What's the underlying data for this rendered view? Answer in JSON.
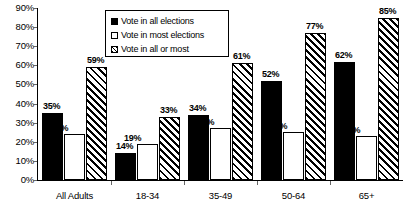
{
  "chart_data": {
    "type": "bar",
    "title": "",
    "xlabel": "",
    "ylabel": "",
    "ylim": [
      0,
      90
    ],
    "grid": false,
    "legend_position": "top-center",
    "categories": [
      "All Adults",
      "18-34",
      "35-49",
      "50-64",
      "65+"
    ],
    "y_ticks": [
      "0%",
      "10%",
      "20%",
      "30%",
      "40%",
      "50%",
      "60%",
      "70%",
      "80%",
      "90%"
    ],
    "series": [
      {
        "name": "Vote in all elections",
        "style": "solid-black",
        "values": [
          35,
          14,
          34,
          52,
          62
        ],
        "labels": [
          "35%",
          "14%",
          "34%",
          "52%",
          "62%"
        ]
      },
      {
        "name": "Vote in most elections",
        "style": "white-outline",
        "values": [
          24,
          19,
          27,
          25,
          23
        ],
        "labels": [
          "24%",
          "19%",
          "27%",
          "25%",
          "23%"
        ]
      },
      {
        "name": "Vote in all or most",
        "style": "diagonal-hatch",
        "values": [
          59,
          33,
          61,
          77,
          85
        ],
        "labels": [
          "59%",
          "33%",
          "61%",
          "77%",
          "85%"
        ]
      }
    ]
  },
  "legend": {
    "items": [
      {
        "label": "Vote in all elections"
      },
      {
        "label": "Vote in most elections"
      },
      {
        "label": "Vote in all or most"
      }
    ]
  }
}
